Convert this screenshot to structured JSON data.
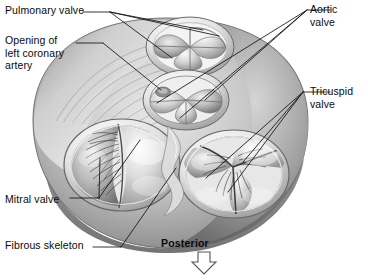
{
  "figure": {
    "orientation_label": "Posterior",
    "orientation_icon": "down-arrow-icon",
    "background_color": "#ffffff",
    "ink_color": "#111111",
    "tissue_light": "#f2f2f2",
    "tissue_mid": "#b8b8b8",
    "tissue_dark": "#6e6e6e",
    "tissue_shadow": "#4a4a4a"
  },
  "labels": [
    {
      "id": "pulmonary",
      "text": "Pulmonary valve",
      "side": "left"
    },
    {
      "id": "coronary",
      "text": "Opening of\nleft coronary\nartery",
      "side": "left"
    },
    {
      "id": "aortic",
      "text": "Aortic\nvalve",
      "side": "right"
    },
    {
      "id": "tricuspid",
      "text": "Tricuspid\nvalve",
      "side": "right"
    },
    {
      "id": "mitral",
      "text": "Mitral valve",
      "side": "left"
    },
    {
      "id": "fibrous",
      "text": "Fibrous skeleton",
      "side": "left"
    }
  ],
  "structures": [
    {
      "name": "pulmonary-valve",
      "cusps": 3,
      "position": "superior-anterior-left"
    },
    {
      "name": "aortic-valve",
      "cusps": 3,
      "position": "central"
    },
    {
      "name": "mitral-valve",
      "cusps": 2,
      "position": "posterior-left"
    },
    {
      "name": "tricuspid-valve",
      "cusps": 3,
      "position": "posterior-right"
    },
    {
      "name": "left-coronary-artery-opening",
      "cusps": 0,
      "position": "aortic-sinus"
    },
    {
      "name": "fibrous-skeleton",
      "cusps": 0,
      "position": "surrounding-annuli"
    }
  ]
}
